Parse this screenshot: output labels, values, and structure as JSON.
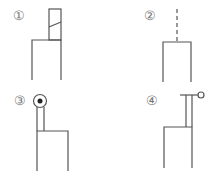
{
  "figure": {
    "panels": [
      {
        "label": "①",
        "description": "rectangle with tall narrow block on top containing a slanted line"
      },
      {
        "label": "②",
        "description": "rectangle with dashed vertical line on top"
      },
      {
        "label": "③",
        "description": "rectangle with narrow stem topped by circle containing filled dot"
      },
      {
        "label": "④",
        "description": "rectangle with narrow stem topped by T-bar ending in small open circle"
      }
    ],
    "colors": {
      "line": "#555555",
      "label": "#777777",
      "background": "#ffffff"
    }
  }
}
